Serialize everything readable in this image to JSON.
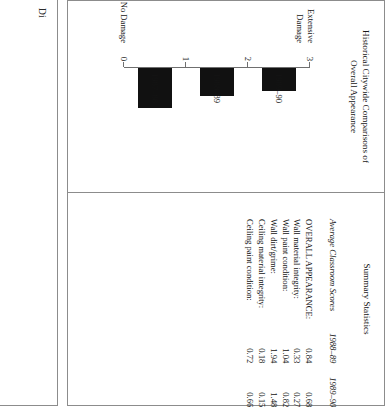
{
  "page": {
    "partial_panel_fragment": "Di"
  },
  "chart_panel": {
    "title_line1": "Historical Citywide Comparisons of",
    "title_line2": "Overall Appearance"
  },
  "chart_data": {
    "type": "bar",
    "title": "Historical Citywide Comparisons of Overall Appearance",
    "xlabel": "",
    "ylabel": "",
    "categories": [
      "1987–88",
      "1988–89",
      "1989–90"
    ],
    "values": [
      1.21,
      0.84,
      0.68
    ],
    "ylim": [
      0,
      3
    ],
    "yticks": [
      0,
      1,
      2,
      3
    ],
    "ytick_labels": [
      "0",
      "1",
      "2",
      "3"
    ],
    "axis_endpoint_low": "No Damage",
    "axis_endpoint_high_line1": "Extensive",
    "axis_endpoint_high_line2": "Damage",
    "grid": false,
    "legend": "none",
    "bar_color": "#111111"
  },
  "stats_panel": {
    "title": "Summary Statistics",
    "columns": [
      "Average Classroom Scores",
      "1988–89",
      "1989–90"
    ],
    "rows": [
      {
        "label": "OVERALL APPEARANCE:",
        "v1988_89": "0.84",
        "v1989_90": "0.68"
      },
      {
        "label": "Wall material integrity:",
        "v1988_89": "0.33",
        "v1989_90": "0.27"
      },
      {
        "label": "Wall paint condition:",
        "v1988_89": "1.04",
        "v1989_90": "0.82"
      },
      {
        "label": "Wall dirt/grime:",
        "v1988_89": "1.94",
        "v1989_90": "1.48"
      },
      {
        "label": "Ceiling material integrity:",
        "v1988_89": "0.18",
        "v1989_90": "0.15"
      },
      {
        "label": "Ceiling paint condition:",
        "v1988_89": "0.72",
        "v1989_90": "0.66"
      }
    ]
  }
}
